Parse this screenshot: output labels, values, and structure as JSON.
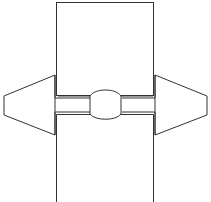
{
  "diagram": {
    "type": "line-drawing",
    "stroke_color": "#333333",
    "background": "#ffffff",
    "shapes": [
      {
        "name": "top-block",
        "kind": "rectangle"
      },
      {
        "name": "bottom-block",
        "kind": "rectangle"
      },
      {
        "name": "left-arrow",
        "kind": "trapezoid"
      },
      {
        "name": "right-arrow",
        "kind": "trapezoid"
      },
      {
        "name": "center-connector",
        "kind": "rounded-oval"
      }
    ]
  }
}
